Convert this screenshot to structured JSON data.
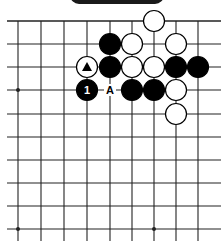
{
  "banner": {
    "label": ""
  },
  "board": {
    "line_color": "#222222",
    "stone_black": "#000000",
    "stone_white": "#ffffff",
    "columns_x": [
      18,
      41,
      64,
      87,
      110,
      132,
      154,
      176,
      198
    ],
    "rows_y": [
      21,
      44,
      67,
      90,
      114,
      137,
      160,
      183,
      206,
      229
    ],
    "extent": {
      "left": 7,
      "right": 221,
      "top": 21,
      "bottom": 241
    },
    "top_edge": true,
    "stone_radius": 10.5,
    "star_points": [
      [
        0,
        3
      ],
      [
        0,
        9
      ],
      [
        6,
        9
      ]
    ],
    "stones": [
      {
        "col": 6,
        "row": 0,
        "color": "white"
      },
      {
        "col": 4,
        "row": 1,
        "color": "black"
      },
      {
        "col": 5,
        "row": 1,
        "color": "white"
      },
      {
        "col": 7,
        "row": 1,
        "color": "white"
      },
      {
        "col": 3,
        "row": 2,
        "color": "white",
        "mark": "triangle"
      },
      {
        "col": 4,
        "row": 2,
        "color": "black"
      },
      {
        "col": 5,
        "row": 2,
        "color": "white"
      },
      {
        "col": 6,
        "row": 2,
        "color": "white"
      },
      {
        "col": 7,
        "row": 2,
        "color": "black"
      },
      {
        "col": 8,
        "row": 2,
        "color": "black"
      },
      {
        "col": 3,
        "row": 3,
        "color": "black",
        "label": "1"
      },
      {
        "col": 5,
        "row": 3,
        "color": "black"
      },
      {
        "col": 6,
        "row": 3,
        "color": "black"
      },
      {
        "col": 7,
        "row": 3,
        "color": "white"
      },
      {
        "col": 7,
        "row": 4,
        "color": "white"
      }
    ],
    "point_labels": [
      {
        "col": 4,
        "row": 3,
        "text": "A"
      }
    ]
  }
}
